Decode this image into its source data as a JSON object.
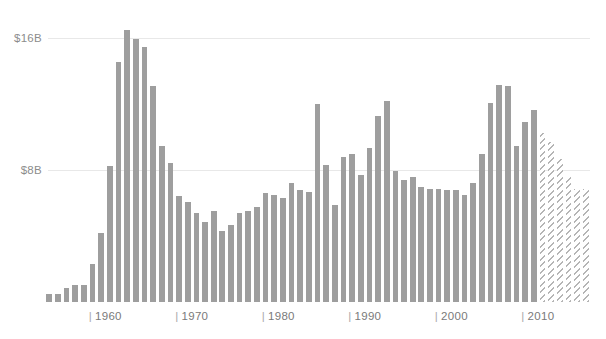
{
  "chart_data": {
    "type": "bar",
    "title": "",
    "subtitle": "",
    "xlabel": "",
    "ylabel": "",
    "ylim": [
      0,
      20
    ],
    "yticks": [
      8,
      16
    ],
    "ytick_labels": [
      "$8B",
      "$16B"
    ],
    "xticks": [
      1960,
      1970,
      1980,
      1990,
      2000,
      2010
    ],
    "xtick_labels": [
      "1960",
      "1970",
      "1980",
      "1990",
      "2000",
      "2010"
    ],
    "grid": true,
    "legend": false,
    "units": "billions of dollars",
    "bar_color": "#9e9e9e",
    "projected_color": "#b5b5b5",
    "gridline_color": "#e8e8e8",
    "series": [
      {
        "name": "Value",
        "x": [
          1955,
          1956,
          1957,
          1958,
          1959,
          1960,
          1961,
          1962,
          1963,
          1964,
          1965,
          1966,
          1967,
          1968,
          1969,
          1970,
          1971,
          1972,
          1973,
          1974,
          1975,
          1976,
          1977,
          1978,
          1979,
          1980,
          1981,
          1982,
          1983,
          1984,
          1985,
          1986,
          1987,
          1988,
          1989,
          1990,
          1991,
          1992,
          1993,
          1994,
          1995,
          1996,
          1997,
          1998,
          1999,
          2000,
          2001,
          2002,
          2003,
          2004,
          2005,
          2006,
          2007,
          2008,
          2009,
          2010,
          2011,
          2012,
          2013,
          2014,
          2015,
          2016,
          2017
        ],
        "values": [
          0.5,
          0.5,
          0.9,
          1.1,
          1.1,
          2.5,
          4.6,
          9.0,
          15.9,
          18.0,
          17.4,
          16.9,
          14.3,
          10.3,
          9.2,
          7.0,
          6.6,
          5.9,
          5.3,
          6.0,
          4.7,
          5.1,
          5.9,
          6.0,
          6.3,
          7.2,
          7.1,
          6.9,
          7.9,
          7.4,
          7.3,
          13.1,
          9.1,
          6.4,
          9.6,
          9.8,
          8.4,
          10.2,
          12.3,
          13.3,
          8.7,
          8.1,
          8.3,
          7.6,
          7.5,
          7.5,
          7.4,
          7.4,
          7.1,
          7.9,
          9.8,
          13.2,
          14.4,
          14.3,
          10.3,
          11.9,
          12.7,
          11.2,
          10.6,
          9.5,
          8.3,
          7.5,
          7.5
        ],
        "projected_from": 2012,
        "projected_label": "projected"
      }
    ]
  },
  "axis": {
    "y_labels": [
      {
        "text": "$16B",
        "value": 16
      },
      {
        "text": "$8B",
        "value": 8
      }
    ],
    "x_labels": [
      {
        "text": "1960",
        "value": 1960,
        "mark": "|"
      },
      {
        "text": "1970",
        "value": 1970,
        "mark": "|"
      },
      {
        "text": "1980",
        "value": 1980,
        "mark": "|"
      },
      {
        "text": "1990",
        "value": 1990,
        "mark": "|"
      },
      {
        "text": "2000",
        "value": 2000,
        "mark": "|"
      },
      {
        "text": "2010",
        "value": 2010,
        "mark": "|"
      }
    ]
  }
}
